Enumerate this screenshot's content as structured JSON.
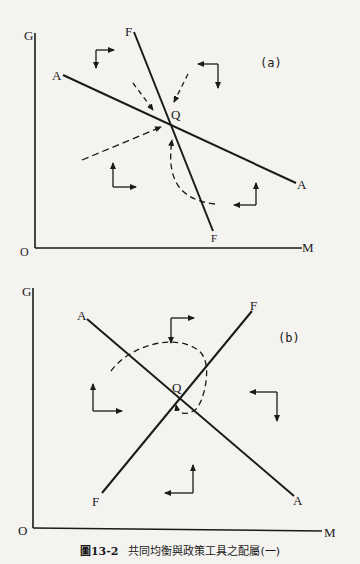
{
  "figure": {
    "caption_number": "圖13-2",
    "caption_text": "共同均衡與政策工具之配屬(一)"
  },
  "panel_a": {
    "tag": "(a)",
    "y_axis_label": "G",
    "x_axis_label": "M",
    "origin_label": "O",
    "line_A_labels": [
      "A",
      "A"
    ],
    "line_F_labels": [
      "F",
      "F"
    ],
    "equilibrium_label": "Q"
  },
  "panel_b": {
    "tag": "(b)",
    "y_axis_label": "G",
    "x_axis_label": "M",
    "origin_label": "O",
    "line_A_labels": [
      "A",
      "A"
    ],
    "line_F_labels": [
      "F",
      "F"
    ],
    "equilibrium_label": "Q"
  },
  "colors": {
    "ink": "#1a1a1a",
    "paper": "#f4f3f0"
  }
}
